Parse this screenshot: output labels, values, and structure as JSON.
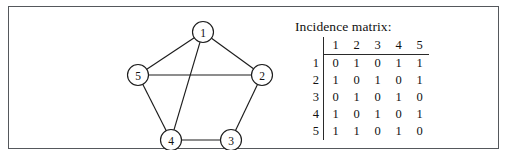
{
  "figure": {
    "border_color": "#55585c",
    "background": "#ffffff"
  },
  "graph": {
    "title": "",
    "node_radius": 10.5,
    "nodes": [
      {
        "id": "1",
        "label": "1",
        "x": 194,
        "y": 25
      },
      {
        "id": "2",
        "label": "2",
        "x": 253,
        "y": 68
      },
      {
        "id": "3",
        "label": "3",
        "x": 222,
        "y": 133
      },
      {
        "id": "4",
        "label": "4",
        "x": 162,
        "y": 133
      },
      {
        "id": "5",
        "label": "5",
        "x": 129,
        "y": 68
      }
    ],
    "edges": [
      {
        "from": "1",
        "to": "2"
      },
      {
        "from": "1",
        "to": "5"
      },
      {
        "from": "1",
        "to": "4"
      },
      {
        "from": "2",
        "to": "3"
      },
      {
        "from": "2",
        "to": "5"
      },
      {
        "from": "3",
        "to": "4"
      },
      {
        "from": "4",
        "to": "5"
      }
    ],
    "edge_color": "#1c1c1c",
    "node_fill": "#ffffff",
    "node_stroke": "#1c1c1c"
  },
  "matrix": {
    "caption": "Incidence matrix:",
    "corner_label": "",
    "column_headers": [
      "1",
      "2",
      "3",
      "4",
      "5"
    ],
    "row_headers": [
      "1",
      "2",
      "3",
      "4",
      "5"
    ],
    "rows": [
      [
        "0",
        "1",
        "0",
        "1",
        "1"
      ],
      [
        "1",
        "0",
        "1",
        "0",
        "1"
      ],
      [
        "0",
        "1",
        "0",
        "1",
        "0"
      ],
      [
        "1",
        "0",
        "1",
        "0",
        "1"
      ],
      [
        "1",
        "1",
        "0",
        "1",
        "0"
      ]
    ]
  },
  "chart_data": {
    "type": "diagram",
    "title": "Incidence matrix:",
    "categories": [
      "1",
      "2",
      "3",
      "4",
      "5"
    ],
    "series": [
      {
        "name": "1",
        "values": [
          0,
          1,
          0,
          1,
          1
        ]
      },
      {
        "name": "2",
        "values": [
          1,
          0,
          1,
          0,
          1
        ]
      },
      {
        "name": "3",
        "values": [
          0,
          1,
          0,
          1,
          0
        ]
      },
      {
        "name": "4",
        "values": [
          1,
          0,
          1,
          0,
          1
        ]
      },
      {
        "name": "5",
        "values": [
          1,
          1,
          0,
          1,
          0
        ]
      }
    ]
  }
}
